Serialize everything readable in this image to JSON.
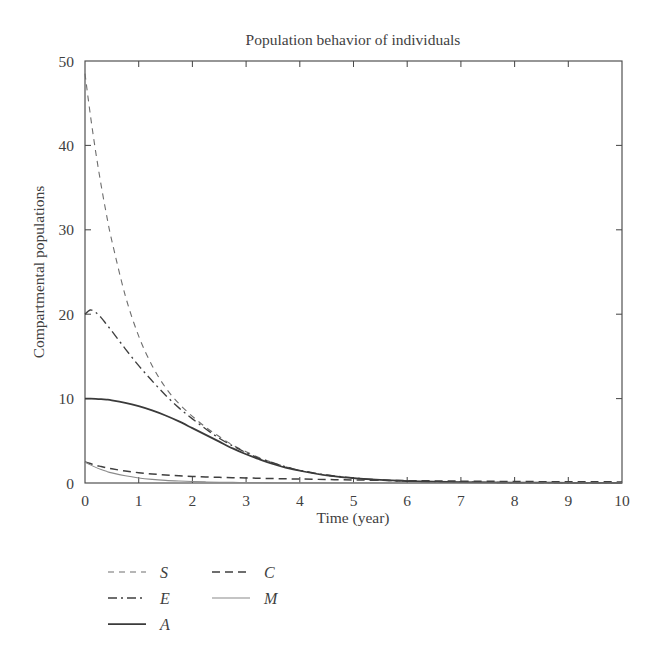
{
  "chart_data": {
    "type": "line",
    "title": "Population behavior of individuals",
    "xlabel": "Time (year)",
    "ylabel": "Compartmental populations",
    "xlim": [
      0,
      10
    ],
    "ylim": [
      0,
      50
    ],
    "xticks": [
      "0",
      "1",
      "2",
      "3",
      "4",
      "5",
      "6",
      "7",
      "8",
      "9",
      "10"
    ],
    "yticks": [
      "0",
      "10",
      "20",
      "30",
      "40",
      "50"
    ],
    "grid": false,
    "legend_position": "below-plot",
    "x": [
      0,
      0.1,
      0.2,
      0.3,
      0.4,
      0.5,
      0.75,
      1,
      1.25,
      1.5,
      1.75,
      2,
      2.25,
      2.5,
      2.75,
      3,
      3.25,
      3.5,
      3.75,
      4,
      4.5,
      5,
      5.5,
      6,
      6.5,
      7,
      7.5,
      8,
      8.5,
      9,
      9.5,
      10
    ],
    "series": [
      {
        "name": "S",
        "style": "dashed",
        "color": "#6e6e6e",
        "width": 1.1,
        "dasharray": "6,5",
        "values": [
          48.5,
          43.6,
          39.2,
          35.3,
          31.8,
          28.7,
          22.2,
          17.4,
          13.9,
          11.3,
          9.4,
          7.9,
          6.6,
          5.5,
          4.5,
          3.7,
          3.0,
          2.4,
          1.9,
          1.5,
          0.9,
          0.55,
          0.33,
          0.2,
          0.13,
          0.09,
          0.06,
          0.05,
          0.04,
          0.03,
          0.03,
          0.02
        ]
      },
      {
        "name": "E",
        "style": "dash-dot",
        "color": "#3f3f3f",
        "width": 1.35,
        "dasharray": "9,4,2,4",
        "values": [
          20.0,
          20.5,
          20.2,
          19.6,
          18.8,
          18.0,
          15.9,
          13.9,
          12.1,
          10.4,
          8.9,
          7.6,
          6.4,
          5.3,
          4.4,
          3.6,
          2.9,
          2.4,
          1.9,
          1.5,
          0.95,
          0.6,
          0.36,
          0.22,
          0.14,
          0.1,
          0.07,
          0.05,
          0.04,
          0.03,
          0.03,
          0.02
        ]
      },
      {
        "name": "A",
        "style": "solid",
        "color": "#3a3a3a",
        "width": 1.75,
        "dasharray": "none",
        "values": [
          10.0,
          10.0,
          9.98,
          9.94,
          9.88,
          9.8,
          9.5,
          9.1,
          8.6,
          8.0,
          7.3,
          6.5,
          5.7,
          4.9,
          4.1,
          3.4,
          2.8,
          2.25,
          1.8,
          1.45,
          0.9,
          0.58,
          0.36,
          0.23,
          0.15,
          0.1,
          0.07,
          0.05,
          0.04,
          0.03,
          0.02,
          0.02
        ]
      },
      {
        "name": "C",
        "style": "dashed",
        "color": "#3f3f3f",
        "width": 1.5,
        "dasharray": "8,5",
        "values": [
          2.5,
          2.3,
          2.1,
          1.95,
          1.8,
          1.68,
          1.42,
          1.22,
          1.07,
          0.95,
          0.85,
          0.78,
          0.72,
          0.67,
          0.63,
          0.6,
          0.56,
          0.53,
          0.5,
          0.47,
          0.41,
          0.36,
          0.32,
          0.28,
          0.25,
          0.22,
          0.2,
          0.18,
          0.16,
          0.15,
          0.14,
          0.13
        ]
      },
      {
        "name": "M",
        "style": "solid",
        "color": "#8a8a8a",
        "width": 1.05,
        "dasharray": "none",
        "values": [
          2.5,
          2.15,
          1.85,
          1.6,
          1.38,
          1.2,
          0.85,
          0.6,
          0.43,
          0.31,
          0.23,
          0.17,
          0.13,
          0.1,
          0.08,
          0.06,
          0.05,
          0.04,
          0.04,
          0.03,
          0.02,
          0.02,
          0.02,
          0.01,
          0.01,
          0.01,
          0.01,
          0.01,
          0.01,
          0.01,
          0.01,
          0.01
        ]
      }
    ]
  },
  "legend": {
    "entries": [
      {
        "label": "S",
        "column": 0,
        "row": 0
      },
      {
        "label": "E",
        "column": 0,
        "row": 1
      },
      {
        "label": "A",
        "column": 0,
        "row": 2
      },
      {
        "label": "C",
        "column": 1,
        "row": 0
      },
      {
        "label": "M",
        "column": 1,
        "row": 1
      }
    ]
  }
}
